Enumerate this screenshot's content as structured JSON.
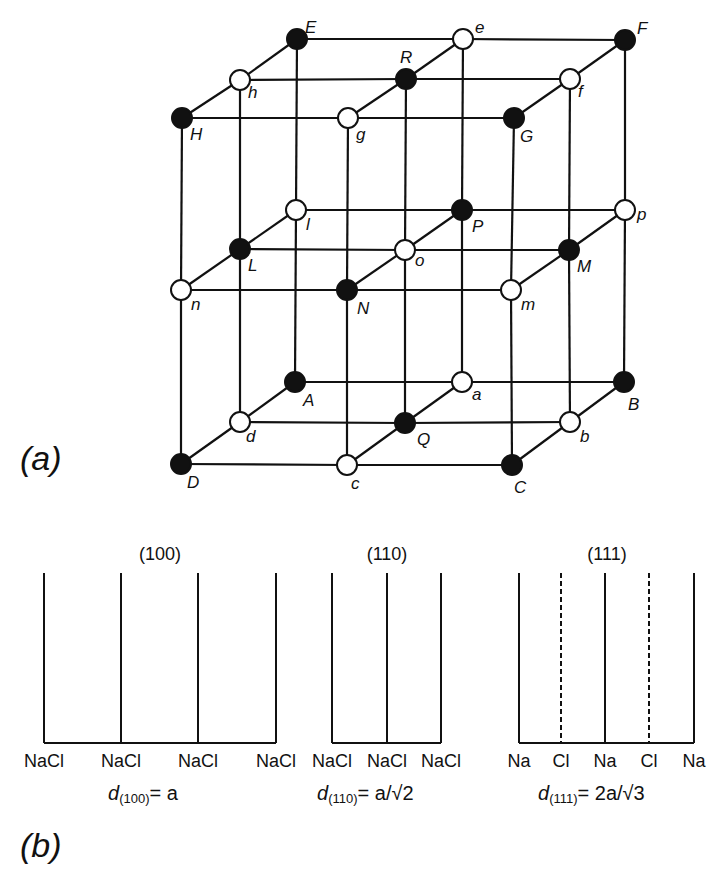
{
  "figure": {
    "part_a": {
      "label": "(a)",
      "description": "NaCl rock-salt lattice: 27 sites, filled = Na, open = Cl",
      "nodes": [
        {
          "id": "E",
          "x": 297,
          "y": 39,
          "filled": true,
          "lx": 8,
          "ly": -6
        },
        {
          "id": "e",
          "x": 463,
          "y": 39,
          "filled": false,
          "lx": 12,
          "ly": -6
        },
        {
          "id": "F",
          "x": 625,
          "y": 40,
          "filled": true,
          "lx": 12,
          "ly": -6
        },
        {
          "id": "h",
          "x": 240,
          "y": 80,
          "filled": false,
          "lx": 8,
          "ly": 18
        },
        {
          "id": "R",
          "x": 406,
          "y": 79,
          "filled": true,
          "lx": -6,
          "ly": -16
        },
        {
          "id": "f",
          "x": 570,
          "y": 79,
          "filled": false,
          "lx": 8,
          "ly": 18
        },
        {
          "id": "H",
          "x": 182,
          "y": 118,
          "filled": true,
          "lx": 8,
          "ly": 22
        },
        {
          "id": "g",
          "x": 348,
          "y": 118,
          "filled": false,
          "lx": 8,
          "ly": 22
        },
        {
          "id": "G",
          "x": 514,
          "y": 118,
          "filled": true,
          "lx": 6,
          "ly": 24
        },
        {
          "id": "l",
          "x": 296,
          "y": 210,
          "filled": false,
          "lx": 10,
          "ly": 20
        },
        {
          "id": "P",
          "x": 462,
          "y": 210,
          "filled": true,
          "lx": 10,
          "ly": 22
        },
        {
          "id": "p",
          "x": 625,
          "y": 210,
          "filled": false,
          "lx": 12,
          "ly": 10
        },
        {
          "id": "L",
          "x": 240,
          "y": 249,
          "filled": true,
          "lx": 8,
          "ly": 22
        },
        {
          "id": "o",
          "x": 405,
          "y": 250,
          "filled": false,
          "lx": 10,
          "ly": 16
        },
        {
          "id": "M",
          "x": 569,
          "y": 250,
          "filled": true,
          "lx": 8,
          "ly": 22
        },
        {
          "id": "n",
          "x": 181,
          "y": 290,
          "filled": false,
          "lx": 10,
          "ly": 20
        },
        {
          "id": "N",
          "x": 347,
          "y": 290,
          "filled": true,
          "lx": 10,
          "ly": 24
        },
        {
          "id": "m",
          "x": 511,
          "y": 290,
          "filled": false,
          "lx": 10,
          "ly": 20
        },
        {
          "id": "A",
          "x": 295,
          "y": 382,
          "filled": true,
          "lx": 8,
          "ly": 24
        },
        {
          "id": "a",
          "x": 462,
          "y": 382,
          "filled": false,
          "lx": 10,
          "ly": 18
        },
        {
          "id": "B",
          "x": 624,
          "y": 382,
          "filled": true,
          "lx": 4,
          "ly": 28
        },
        {
          "id": "d",
          "x": 240,
          "y": 422,
          "filled": false,
          "lx": 6,
          "ly": 20
        },
        {
          "id": "Q",
          "x": 405,
          "y": 423,
          "filled": true,
          "lx": 12,
          "ly": 22
        },
        {
          "id": "b",
          "x": 570,
          "y": 422,
          "filled": false,
          "lx": 10,
          "ly": 20
        },
        {
          "id": "D",
          "x": 181,
          "y": 464,
          "filled": true,
          "lx": 6,
          "ly": 24
        },
        {
          "id": "c",
          "x": 347,
          "y": 465,
          "filled": false,
          "lx": 4,
          "ly": 24
        },
        {
          "id": "C",
          "x": 512,
          "y": 465,
          "filled": true,
          "lx": 2,
          "ly": 28
        }
      ]
    },
    "part_b": {
      "label": "(b)",
      "panels": [
        {
          "title": "(100)",
          "title_x": 160,
          "lines": [
            {
              "x": 44,
              "dashed": false
            },
            {
              "x": 121,
              "dashed": false
            },
            {
              "x": 198,
              "dashed": false
            },
            {
              "x": 276,
              "dashed": false
            }
          ],
          "labels": [
            "NaCl",
            "NaCl",
            "NaCl",
            "NaCl"
          ],
          "formula_lhs": "d",
          "formula_sub": "(100)",
          "formula_rhs": "= a",
          "formula_x": 108
        },
        {
          "title": "(110)",
          "title_x": 387,
          "lines": [
            {
              "x": 332,
              "dashed": false
            },
            {
              "x": 387,
              "dashed": false
            },
            {
              "x": 441,
              "dashed": false
            }
          ],
          "labels": [
            "NaCl",
            "NaCl",
            "NaCl"
          ],
          "formula_lhs": "d",
          "formula_sub": "(110)",
          "formula_rhs": "= a/√2",
          "formula_x": 317
        },
        {
          "title": "(111)",
          "title_x": 607,
          "lines": [
            {
              "x": 519,
              "dashed": false
            },
            {
              "x": 561,
              "dashed": true
            },
            {
              "x": 605,
              "dashed": false
            },
            {
              "x": 649,
              "dashed": true
            },
            {
              "x": 694,
              "dashed": false
            }
          ],
          "labels": [
            "Na",
            "Cl",
            "Na",
            "Cl",
            "Na"
          ],
          "formula_lhs": "d",
          "formula_sub": "(111)",
          "formula_rhs": "= 2a/√3",
          "formula_x": 538
        }
      ]
    }
  }
}
